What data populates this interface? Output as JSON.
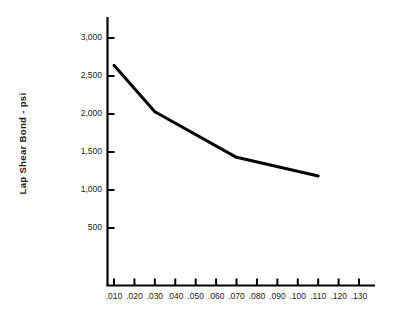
{
  "chart_data": {
    "type": "line",
    "title": "",
    "subtitle": "",
    "xlabel": "",
    "ylabel": "Lap Shear Bond - psi",
    "x": [
      0.01,
      0.03,
      0.07,
      0.11
    ],
    "values": [
      2640,
      2030,
      1430,
      1185
    ],
    "series": [
      {
        "name": "Lap Shear Bond",
        "color": "#000000",
        "points": [
          {
            "x": 0.01,
            "y": 2640
          },
          {
            "x": 0.03,
            "y": 2030
          },
          {
            "x": 0.07,
            "y": 1430
          },
          {
            "x": 0.11,
            "y": 1185
          }
        ]
      }
    ],
    "xlim": [
      0.0,
      0.14
    ],
    "ylim": [
      0,
      3150
    ],
    "xticks": [
      0.01,
      0.02,
      0.03,
      0.04,
      0.05,
      0.06,
      0.07,
      0.08,
      0.09,
      0.1,
      0.11,
      0.12,
      0.13
    ],
    "xticklabels": [
      ".010",
      ".020",
      ".030",
      ".040",
      ".050",
      ".060",
      ".070",
      ".080",
      ".090",
      ".100",
      ".110",
      ".120",
      ".130"
    ],
    "yticks": [
      500,
      1000,
      1500,
      2000,
      2500,
      3000
    ],
    "yticklabels": [
      "500",
      "1,000",
      "1,500",
      "2,000",
      "2,500",
      "3,000"
    ],
    "grid": false,
    "legend": null,
    "legend_position": "none",
    "annotations": [],
    "colors": {
      "line": "#000000",
      "axis": "#000000",
      "text": "#1a1a1a",
      "background": "#ffffff"
    },
    "line_width": 3
  }
}
